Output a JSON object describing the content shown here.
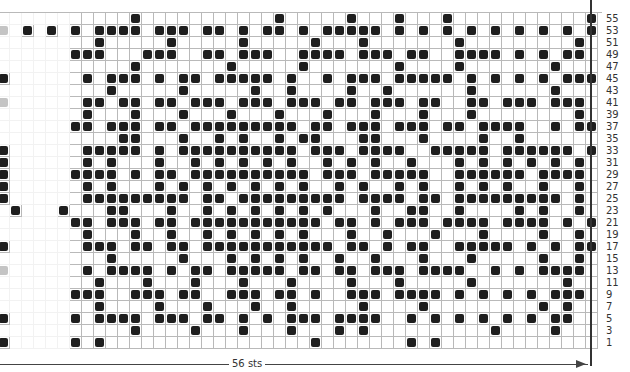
{
  "chart": {
    "title": "",
    "columns": 50,
    "row_labels": [
      "55",
      "53",
      "51",
      "49",
      "47",
      "45",
      "43",
      "41",
      "39",
      "37",
      "35",
      "33",
      "31",
      "29",
      "27",
      "25",
      "23",
      "21",
      "19",
      "17",
      "15",
      "13",
      "11",
      "9",
      "7",
      "5",
      "3",
      "1"
    ],
    "width_label": "56 sts",
    "legend": {
      "#": "contrast color (dark)",
      ".": "main color (white)",
      "g": "gray"
    },
    "colors": {
      "dark": "#1e1e1e",
      "grid": "#b9b9b9",
      "gray": "#c4c4c4",
      "background": "#ffffff"
    },
    "rows": [
      "...........#...........#.....#...#...#...........#",
      "g.#.#.#.####.###.##.#.##.#.#####.#.#.#.#.#.#.#.#.##",
      "........#.....#.....#.....#...#.......#.........#.",
      "......###...###..##.###..####.###.##..####.#.#.##.#",
      "...........#.......#.....#.......#....#.......#....",
      "#......#.###.#.##.#####.#..#.###.#####.#.#.#.#.###",
      ".........#.....#.....#..#....#..#......#......#...",
      "g......##.##.##.###.###.###.##.###.##..##.###.###.#",
      ".......#...#...#...#...#...#...#...#...#........#.",
      "......##.###.##.#########.##.###.###.##.####..#.##",
      "..........##...#..#.#..#.##...##...#....#..#.....",
      "#......#####.#.##########.###.####..#####.######.#",
      "#......#.#...#..#.#.#.#.#..#.#.#..#...#.#.#.#.#.#",
      "#.....####.#.##.##########.###.#####..######.####",
      "#......#.#...#.#.#.#.#.#.#..#.#..#.#..#.#.#..#..#",
      "#......#########.##.#########.####.##.#########.#",
      ".#...#...##...#..#.#.#.#.#.#...#..##..#....#.#..#",
      "......##.###.##.###########.##.#.###.####.####.#.#",
      ".......#...#..#..#.#.#.#.#...#..#...#...#....#..#",
      "#......###.##.##.###########.##.#.##..#####.#.#.##",
      ".........#.....#...#.#.#.#..#..#...#...#.....#..#",
      "g......#.####.#.##.#####.##.##.###.####..#.#.####",
      "........#...#...#...#...#....#...#.....#.......#.",
      "......###..###.##..###.##.#..###.####.#.#.#.#.###",
      "........#....#...#...#..#.....#....#.........#.#.",
      "#.....#.####.###.##.#.#.###.####..#.#.#.#.#.#.##",
      "...........#....#...#...#...#.#..........#....#.",
      "#.....#.#.................#.......#.#............"
    ]
  }
}
